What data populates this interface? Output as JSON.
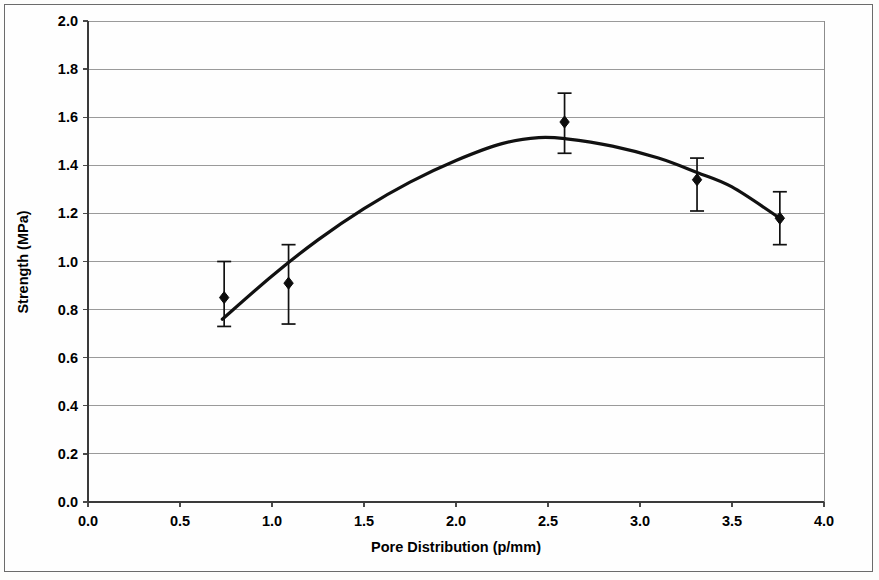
{
  "chart_data": {
    "type": "scatter",
    "title": "",
    "xlabel": "Pore Distribution (p/mm)",
    "ylabel": "Strength (MPa)",
    "xlim": [
      0.0,
      4.0
    ],
    "ylim": [
      0.0,
      2.0
    ],
    "xticks": [
      "0.0",
      "0.5",
      "1.0",
      "1.5",
      "2.0",
      "2.5",
      "3.0",
      "3.5",
      "4.0"
    ],
    "xtick_values": [
      0.0,
      0.5,
      1.0,
      1.5,
      2.0,
      2.5,
      3.0,
      3.5,
      4.0
    ],
    "yticks": [
      "0.0",
      "0.2",
      "0.4",
      "0.6",
      "0.8",
      "1.0",
      "1.2",
      "1.4",
      "1.6",
      "1.8",
      "2.0"
    ],
    "ytick_values": [
      0.0,
      0.2,
      0.4,
      0.6,
      0.8,
      1.0,
      1.2,
      1.4,
      1.6,
      1.8,
      2.0
    ],
    "grid": "horizontal",
    "legend": "none",
    "x": [
      0.74,
      1.09,
      2.59,
      3.31,
      3.76
    ],
    "values": [
      0.85,
      0.91,
      1.58,
      1.34,
      1.18
    ],
    "error_upper": [
      1.0,
      1.07,
      1.7,
      1.43,
      1.29
    ],
    "error_lower": [
      0.73,
      0.74,
      1.45,
      1.21,
      1.07
    ],
    "error_plus": [
      0.15,
      0.16,
      0.12,
      0.09,
      0.11
    ],
    "error_minus": [
      0.12,
      0.17,
      0.13,
      0.13,
      0.11
    ],
    "fit_curve": {
      "label": "quadratic trendline",
      "x_start": 0.73,
      "x_end": 3.76,
      "y_start": 0.76,
      "y_end": 1.18,
      "vertex_x": 2.45,
      "vertex_y": 1.515,
      "points_x": [
        0.73,
        1.0,
        1.25,
        1.5,
        1.75,
        2.0,
        2.25,
        2.45,
        2.6,
        2.85,
        3.1,
        3.31,
        3.5,
        3.76
      ],
      "points_y": [
        0.76,
        0.94,
        1.09,
        1.22,
        1.33,
        1.42,
        1.49,
        1.515,
        1.51,
        1.48,
        1.43,
        1.37,
        1.31,
        1.18
      ]
    }
  },
  "axes": {
    "x_title": "Pore Distribution (p/mm)",
    "y_title": "Strength (MPa)"
  }
}
